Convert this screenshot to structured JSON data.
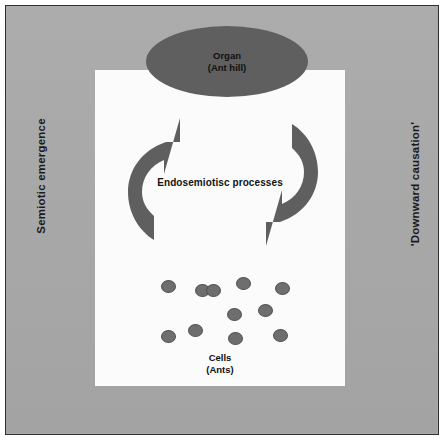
{
  "figure": {
    "background_color": "#a9a9a9",
    "panel_color": "#fbfbfb",
    "shape_color": "#5f5f5f",
    "border_color": "#2e2e2e"
  },
  "organ": {
    "line1": "Organ",
    "line2": "(Ant hill)"
  },
  "center": {
    "label": "Endosemiotisc processes"
  },
  "cells": {
    "line1": "Cells",
    "line2": "(Ants)",
    "count": 11,
    "dots": [
      {
        "x": 6,
        "y": 8
      },
      {
        "x": 40,
        "y": 12
      },
      {
        "x": 51,
        "y": 12
      },
      {
        "x": 81,
        "y": 5
      },
      {
        "x": 120,
        "y": 10
      },
      {
        "x": 72,
        "y": 36
      },
      {
        "x": 103,
        "y": 32
      },
      {
        "x": 6,
        "y": 58
      },
      {
        "x": 33,
        "y": 52
      },
      {
        "x": 73,
        "y": 60
      },
      {
        "x": 118,
        "y": 57
      }
    ]
  },
  "side_labels": {
    "left": "Semiotic emergence",
    "right": "'Downward causation'"
  },
  "arrows": {
    "upward_arrow_name": "semiotic-emergence-arrow",
    "downward_arrow_name": "downward-causation-arrow"
  }
}
